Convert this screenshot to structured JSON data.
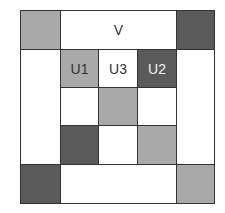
{
  "diagram": {
    "labels": {
      "top": "V",
      "u1": "U1",
      "u3": "U3",
      "u2": "U2"
    },
    "colors": {
      "light_gray": "#a9a9a9",
      "dark_gray": "#5a5a5a",
      "white": "#ffffff",
      "border": "#333333"
    },
    "grid": [
      [
        "light",
        "white:V",
        "white:V",
        "white:V",
        "dark"
      ],
      [
        "white",
        "light:U1",
        "white:U3",
        "dark:U2",
        "white"
      ],
      [
        "white",
        "white",
        "light",
        "white",
        "white"
      ],
      [
        "white",
        "dark",
        "white",
        "light",
        "white"
      ],
      [
        "dark",
        "white",
        "white",
        "white",
        "light"
      ]
    ]
  }
}
